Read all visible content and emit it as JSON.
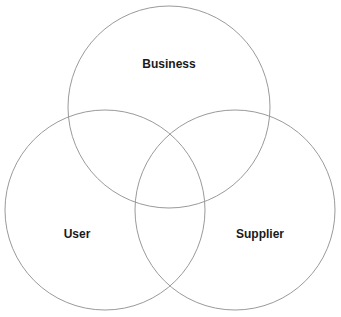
{
  "diagram": {
    "type": "venn",
    "stroke_color": "#9a9a9a",
    "label_color": "#1a1a1a",
    "background": "#ffffff",
    "sets": [
      {
        "id": "business",
        "label": "Business",
        "cx": 169,
        "cy": 107,
        "r": 101,
        "label_x": 169,
        "label_y": 68
      },
      {
        "id": "user",
        "label": "User",
        "cx": 105,
        "cy": 210,
        "r": 100,
        "label_x": 77,
        "label_y": 238
      },
      {
        "id": "supplier",
        "label": "Supplier",
        "cx": 235,
        "cy": 210,
        "r": 100,
        "label_x": 260,
        "label_y": 238
      }
    ]
  }
}
